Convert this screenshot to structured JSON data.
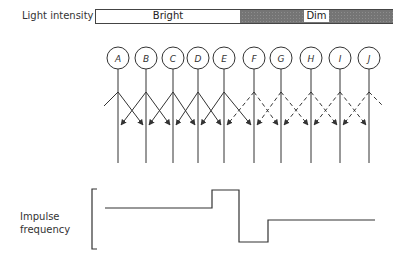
{
  "light_intensity": {
    "label": "Light intensity",
    "bright_label": "Bright",
    "dim_label": "Dim"
  },
  "receptors": {
    "labels": [
      "A",
      "B",
      "C",
      "D",
      "E",
      "F",
      "G",
      "H",
      "I",
      "J"
    ],
    "bright_receptors": [
      "A",
      "B",
      "C",
      "D",
      "E"
    ],
    "dim_receptors": [
      "F",
      "G",
      "H",
      "I",
      "J"
    ],
    "inhibition_style": {
      "bright": "solid",
      "dim": "dashed"
    }
  },
  "impulse_frequency": {
    "label_line1": "Impulse",
    "label_line2": "frequency",
    "profile": [
      {
        "segment": "A-D",
        "level": "medium-high"
      },
      {
        "segment": "E",
        "level": "peak"
      },
      {
        "segment": "F",
        "level": "trough"
      },
      {
        "segment": "G-J",
        "level": "medium-low"
      }
    ]
  }
}
